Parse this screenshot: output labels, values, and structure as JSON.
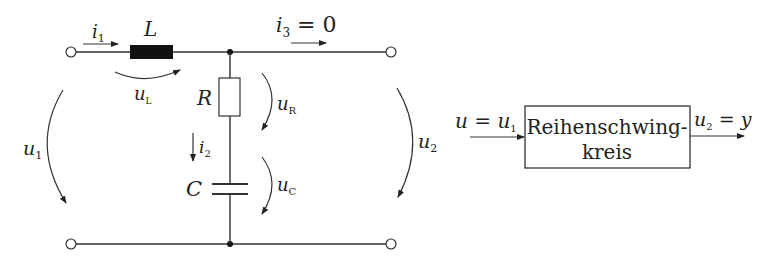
{
  "circuit": {
    "labels": {
      "i1": {
        "main": "i",
        "sub": "1"
      },
      "L": "L",
      "uL": {
        "main": "u",
        "sub": "L"
      },
      "i3": {
        "main": "i",
        "sub": "3",
        "rest": " = 0"
      },
      "R": "R",
      "uR": {
        "main": "u",
        "sub": "R"
      },
      "i2": {
        "main": "i",
        "sub": "2"
      },
      "C": "C",
      "uC": {
        "main": "u",
        "sub": "C"
      },
      "u1": {
        "main": "u",
        "sub": "1"
      },
      "u2": {
        "main": "u",
        "sub": "2"
      }
    }
  },
  "block": {
    "input_label": {
      "lhs": "u",
      "eq": " = ",
      "rhs": "u",
      "rhs_sub": "1"
    },
    "title_line1": "Reihenschwing-",
    "title_line2": "kreis",
    "output_label": {
      "lhs": "u",
      "lhs_sub": "2",
      "eq": " = ",
      "rhs": "y"
    }
  },
  "colors": {
    "line": "#333333",
    "inductor_fill": "#111111",
    "background": "#ffffff"
  }
}
